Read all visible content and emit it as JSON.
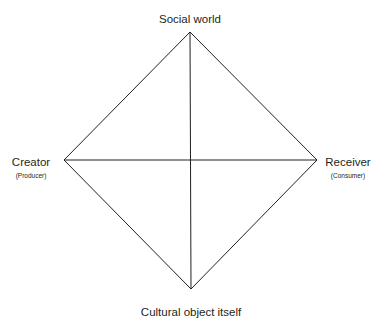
{
  "diagram": {
    "title": "",
    "nodes": {
      "top": {
        "label": "Social world",
        "sublabel": ""
      },
      "bottom": {
        "label": "Cultural object itself",
        "sublabel": ""
      },
      "left": {
        "label": "Creator",
        "sublabel": "(Producer)"
      },
      "right": {
        "label": "Receiver",
        "sublabel": "(Consumer)"
      }
    },
    "edges": [
      {
        "from": "top",
        "to": "right"
      },
      {
        "from": "right",
        "to": "bottom"
      },
      {
        "from": "bottom",
        "to": "left"
      },
      {
        "from": "left",
        "to": "top"
      },
      {
        "from": "top",
        "to": "bottom"
      },
      {
        "from": "left",
        "to": "right"
      }
    ],
    "line_color": "#231f20"
  }
}
